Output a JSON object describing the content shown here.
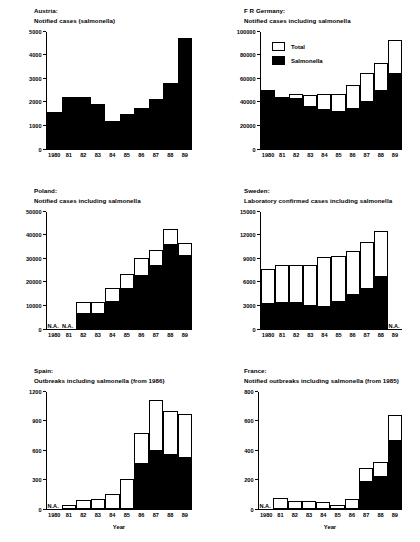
{
  "figure": {
    "xlabel": "Year",
    "na_label": "N.A.",
    "legend": {
      "total": "Total",
      "salmonella": "Salmonella"
    }
  },
  "chart_data": [
    {
      "type": "bar",
      "panel": "austria",
      "title_line1": "Austria:",
      "title_line2": "Notified cases (salmonella)",
      "categories": [
        "1980",
        "81",
        "82",
        "83",
        "84",
        "85",
        "86",
        "87",
        "88",
        "89"
      ],
      "yticks": [
        0,
        1000,
        2000,
        3000,
        4000,
        5000
      ],
      "ylim": [
        0,
        5000
      ],
      "xlabel": "",
      "ylabel": "",
      "grid": false,
      "series": [
        {
          "name": "Salmonella",
          "values": [
            1550,
            2200,
            2200,
            1900,
            1170,
            1500,
            1750,
            2100,
            2800,
            4720
          ]
        }
      ],
      "na_years": []
    },
    {
      "type": "bar",
      "panel": "fr-germany",
      "title_line1": "F R Germany:",
      "title_line2": "Notified cases including salmonella",
      "categories": [
        "1980",
        "81",
        "82",
        "83",
        "84",
        "85",
        "86",
        "87",
        "88",
        "89"
      ],
      "yticks": [
        0,
        20000,
        40000,
        60000,
        80000,
        100000
      ],
      "ylim": [
        0,
        100000
      ],
      "xlabel": "",
      "ylabel": "",
      "grid": false,
      "legend_position": "top-left",
      "series": [
        {
          "name": "Total",
          "values": [
            50000,
            44000,
            47000,
            46000,
            47000,
            47000,
            54000,
            64000,
            73000,
            92000
          ]
        },
        {
          "name": "Salmonella",
          "values": [
            50000,
            44000,
            43000,
            36500,
            33500,
            32500,
            34500,
            40500,
            50000,
            64500
          ]
        }
      ],
      "na_years": []
    },
    {
      "type": "bar",
      "panel": "poland",
      "title_line1": "Poland:",
      "title_line2": "Notified cases including salmonella",
      "categories": [
        "1980",
        "81",
        "82",
        "83",
        "84",
        "85",
        "86",
        "87",
        "88",
        "89"
      ],
      "yticks": [
        0,
        10000,
        20000,
        30000,
        40000,
        50000
      ],
      "ylim": [
        0,
        50000
      ],
      "xlabel": "",
      "ylabel": "",
      "grid": false,
      "series": [
        {
          "name": "Total",
          "values": [
            null,
            null,
            11500,
            11500,
            17200,
            23500,
            30300,
            33400,
            42200,
            36600
          ]
        },
        {
          "name": "Salmonella",
          "values": [
            null,
            null,
            6700,
            6700,
            12000,
            17500,
            23000,
            27200,
            36000,
            31500
          ]
        }
      ],
      "na_years": [
        "1980",
        "81"
      ]
    },
    {
      "type": "bar",
      "panel": "sweden",
      "title_line1": "Sweden:",
      "title_line2": "Laboratory confirmed cases including salmonella",
      "categories": [
        "1980",
        "81",
        "82",
        "83",
        "84",
        "85",
        "86",
        "87",
        "88",
        "89"
      ],
      "yticks": [
        0,
        3000,
        6000,
        9000,
        12000,
        15000
      ],
      "ylim": [
        0,
        15000
      ],
      "xlabel": "",
      "ylabel": "",
      "grid": false,
      "series": [
        {
          "name": "Total",
          "values": [
            7600,
            8200,
            8200,
            8150,
            9150,
            9300,
            9900,
            11000,
            12500,
            null
          ]
        },
        {
          "name": "Salmonella",
          "values": [
            3300,
            3450,
            3450,
            3000,
            2950,
            3600,
            4400,
            5200,
            6800,
            null
          ]
        }
      ],
      "na_years": [
        "89"
      ]
    },
    {
      "type": "bar",
      "panel": "spain",
      "title_line1": "Spain:",
      "title_line2": "Outbreaks including salmonella (from 1986)",
      "categories": [
        "1980",
        "81",
        "82",
        "83",
        "84",
        "85",
        "86",
        "87",
        "88",
        "89"
      ],
      "yticks": [
        0,
        300,
        600,
        900,
        1200
      ],
      "ylim": [
        0,
        1200
      ],
      "xlabel": "Year",
      "ylabel": "",
      "grid": false,
      "series": [
        {
          "name": "Total",
          "values": [
            null,
            40,
            90,
            100,
            150,
            310,
            770,
            1105,
            995,
            970
          ]
        },
        {
          "name": "Salmonella",
          "values": [
            null,
            0,
            0,
            0,
            0,
            0,
            470,
            600,
            555,
            525
          ]
        }
      ],
      "na_years": [
        "1980"
      ]
    },
    {
      "type": "bar",
      "panel": "france",
      "title_line1": "France:",
      "title_line2": "Notified outbreaks including salmonella (from 1985)",
      "categories": [
        "1980",
        "81",
        "82",
        "83",
        "84",
        "85",
        "86",
        "87",
        "88",
        "89"
      ],
      "yticks": [
        0,
        200,
        400,
        600,
        800
      ],
      "ylim": [
        0,
        800
      ],
      "xlabel": "Year",
      "ylabel": "",
      "grid": false,
      "series": [
        {
          "name": "Total",
          "values": [
            null,
            72,
            55,
            55,
            48,
            28,
            70,
            275,
            320,
            635
          ]
        },
        {
          "name": "Salmonella",
          "values": [
            null,
            0,
            0,
            0,
            0,
            0,
            0,
            190,
            225,
            470
          ]
        }
      ],
      "na_years": [
        "1980"
      ]
    }
  ]
}
